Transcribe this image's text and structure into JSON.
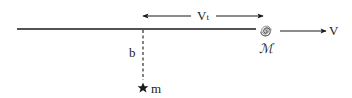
{
  "diagram": {
    "labels": {
      "transverse_velocity": "V",
      "transverse_velocity_sub": "t",
      "impact_parameter": "b",
      "mass_point": "m",
      "galaxy_mass": "ℳ",
      "galaxy_velocity": "V"
    },
    "elements": {
      "trajectory_line": "horizontal path of galaxy",
      "impact_line": "dashed perpendicular from trajectory to mass m",
      "double_arrow": "transverse velocity arrow",
      "galaxy_icon": "spiral galaxy",
      "star_icon": "star (point mass m)",
      "velocity_arrow": "galaxy velocity arrow"
    },
    "colors": {
      "stroke": "#1a1a1a",
      "background": "#ffffff"
    }
  }
}
